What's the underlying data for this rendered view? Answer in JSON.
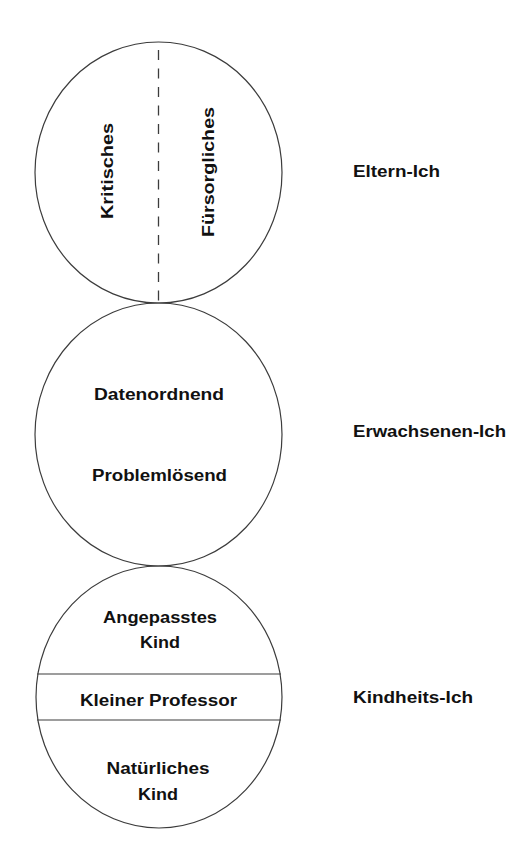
{
  "diagram": {
    "type": "ego-state-model",
    "states": [
      {
        "name": "Eltern-Ich",
        "parts": [
          "Kritisches",
          "Fürsorgliches"
        ],
        "division": "vertical-dashed"
      },
      {
        "name": "Erwachsenen-Ich",
        "lines": [
          "Datenordnend",
          "Problemlösend"
        ]
      },
      {
        "name": "Kindheits-Ich",
        "sections": [
          {
            "lines": [
              "Angepasstes",
              "Kind"
            ]
          },
          {
            "lines": [
              "Kleiner Professor"
            ]
          },
          {
            "lines": [
              "Natürliches",
              "Kind"
            ]
          }
        ],
        "division": "horizontal-solid"
      }
    ]
  },
  "labels": {
    "parent": "Eltern-Ich",
    "adult": "Erwachsenen-Ich",
    "child": "Kindheits-Ich"
  },
  "parent": {
    "left": "Kritisches",
    "right": "Fürsorgliches"
  },
  "adult": {
    "line1": "Datenordnend",
    "line2": "Problemlösend"
  },
  "child": {
    "top_line1": "Angepasstes",
    "top_line2": "Kind",
    "middle": "Kleiner Professor",
    "bottom_line1": "Natürliches",
    "bottom_line2": "Kind"
  },
  "colors": {
    "stroke": "#3c3c3c",
    "text": "#111111",
    "background": "#ffffff"
  }
}
